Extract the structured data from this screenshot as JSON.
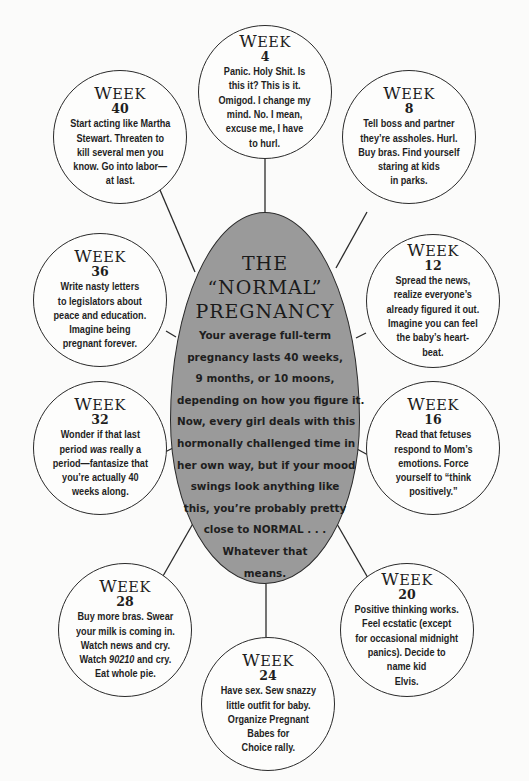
{
  "center": {
    "title_lines": [
      "THE",
      "“NORMAL”",
      "PREGNANCY"
    ],
    "body_lines": [
      "Your average full-term",
      "pregnancy lasts 40 weeks,",
      "9 months, or 10 moons,",
      "depending on how you figure it.",
      "Now, every girl deals with this",
      "hormonally challenged time in",
      "her own way, but if your mood",
      "swings look anything like",
      "this, you’re probably pretty",
      "close to NORMAL . . .",
      "Whatever that",
      "means."
    ],
    "fill_color": "#9a9a9a"
  },
  "week_label": "Week",
  "weeks": [
    {
      "week": "4",
      "lines": [
        "Panic. Holy Shit. Is",
        "this it? This is it.",
        "Omigod. I change my",
        "mind. No. I mean,",
        "excuse me, I have",
        "to hurl."
      ]
    },
    {
      "week": "8",
      "lines": [
        "Tell boss and partner",
        "they’re assholes. Hurl.",
        "Buy bras. Find yourself",
        "staring at kids",
        "in parks."
      ]
    },
    {
      "week": "12",
      "lines": [
        "Spread the news,",
        "realize everyone’s",
        "already figured it out.",
        "Imagine you can feel",
        "the baby’s heart-",
        "beat."
      ]
    },
    {
      "week": "16",
      "lines": [
        "Read that fetuses",
        "respond to Mom’s",
        "emotions. Force",
        "yourself to “think",
        "positively.”"
      ]
    },
    {
      "week": "20",
      "lines": [
        "Positive thinking works.",
        "Feel ecstatic (except",
        "for occasional midnight",
        "panics). Decide to",
        "name kid",
        "Elvis."
      ]
    },
    {
      "week": "24",
      "lines": [
        "Have sex. Sew snazzy",
        "little outfit for baby.",
        "Organize Pregnant",
        "Babes for",
        "Choice rally."
      ]
    },
    {
      "week": "28",
      "lines": [
        "Buy more bras. Swear",
        "your milk is coming in.",
        "Watch news and cry.",
        "Watch 90210 and cry.",
        "Eat whole pie."
      ],
      "italic_fragment": "90210"
    },
    {
      "week": "32",
      "lines": [
        "Wonder if that last",
        "period was really a",
        "period—fantasize that",
        "you’re actually 40",
        "weeks along."
      ],
      "italic_fragment": "was"
    },
    {
      "week": "36",
      "lines": [
        "Write nasty letters",
        "to legislators about",
        "peace and education.",
        "Imagine being",
        "pregnant forever."
      ]
    },
    {
      "week": "40",
      "lines": [
        "Start acting like Martha",
        "Stewart. Threaten to",
        "kill several men you",
        "know. Go into labor—",
        "at last."
      ]
    }
  ]
}
